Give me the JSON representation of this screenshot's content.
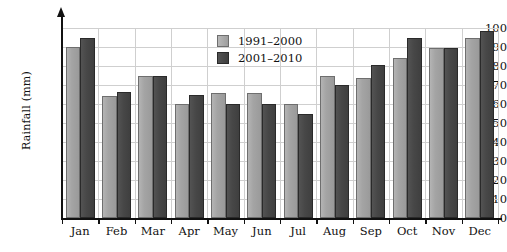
{
  "chart_data": {
    "type": "bar",
    "title": "",
    "xlabel": "",
    "ylabel": "Rainfall (mm)",
    "ylim": [
      0,
      100
    ],
    "ytick_step": 10,
    "yticks": [
      "0",
      "10",
      "20",
      "30",
      "40",
      "50",
      "60",
      "70",
      "80",
      "90",
      "100"
    ],
    "grid": true,
    "legend_position": "top-center",
    "categories": [
      "Jan",
      "Feb",
      "Mar",
      "Apr",
      "May",
      "Jun",
      "Jul",
      "Aug",
      "Sep",
      "Oct",
      "Nov",
      "Dec"
    ],
    "series": [
      {
        "name": "1991–2000",
        "color": "#a4a4a4",
        "values": [
          90,
          64,
          74.5,
          60,
          66,
          66,
          60,
          74.5,
          73.5,
          84,
          89.5,
          94.5
        ]
      },
      {
        "name": "2001–2010",
        "color": "#474747",
        "values": [
          95,
          66.5,
          74.5,
          65,
          60,
          60,
          55,
          70,
          80.5,
          95,
          89.5,
          98.5
        ]
      }
    ]
  },
  "legend": {
    "entries": [
      {
        "label": "1991–2000"
      },
      {
        "label": "2001–2010"
      }
    ]
  },
  "axes": {
    "y_title": "Rainfall (mm)"
  }
}
